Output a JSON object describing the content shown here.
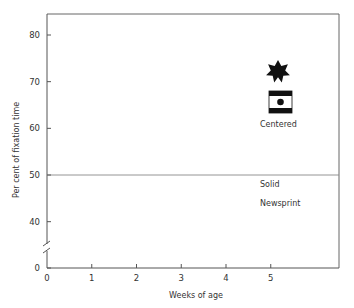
{
  "chart_data": {
    "type": "line",
    "title": "",
    "xlabel": "Weeks of age",
    "ylabel": "Per cent of fixation time",
    "xlim": [
      0,
      6
    ],
    "ylim": [
      30,
      85
    ],
    "axis_break": true,
    "x_ticks": [
      0,
      1,
      2,
      3,
      4,
      5
    ],
    "y_ticks": [
      0,
      40,
      50,
      60,
      70,
      80
    ],
    "reference_line": 50,
    "grid": false,
    "legend_position": "right, inline at line ends",
    "x": [
      0.5,
      1.5,
      2.5,
      3.5,
      4.5
    ],
    "series": [
      {
        "name": "Star",
        "icon": "star-icon",
        "marker": "filled",
        "style": "solid",
        "values": [
          67.7,
          66.2,
          72.2,
          78.3,
          72.5
        ]
      },
      {
        "name": "Bullseye",
        "icon": "bullseye-icon",
        "marker": "filled",
        "style": "solid",
        "values": [
          63.8,
          68.2,
          73.8,
          72.9,
          63.5
        ]
      },
      {
        "name": "Centered",
        "marker": "dotted-circle",
        "style": "dash-dot",
        "values": [
          58.1,
          63.6,
          52.9,
          58.8,
          61.0
        ]
      },
      {
        "name": "Checkerboard",
        "icon": "checkerboard-icon",
        "marker": "filled",
        "style": "solid",
        "values": [
          52.1,
          55.7,
          66.0,
          55.3,
          53.7
        ]
      },
      {
        "name": "Solid",
        "marker": "open-circle",
        "style": "dashed",
        "values": [
          50.0,
          48.9,
          49.2,
          46.9,
          48.0
        ]
      },
      {
        "name": "Newsprint",
        "marker": "filled",
        "style": "solid",
        "values": [
          36.8,
          44.1,
          47.8,
          53.4,
          44.1
        ]
      }
    ]
  },
  "labels": {
    "centered": "Centered",
    "solid": "Solid",
    "newsprint": "Newsprint",
    "xlabel": "Weeks of age",
    "ylabel": "Per cent of fixation time"
  },
  "colors": {
    "line": "#222222",
    "frame": "#555555",
    "background": "#ffffff"
  }
}
